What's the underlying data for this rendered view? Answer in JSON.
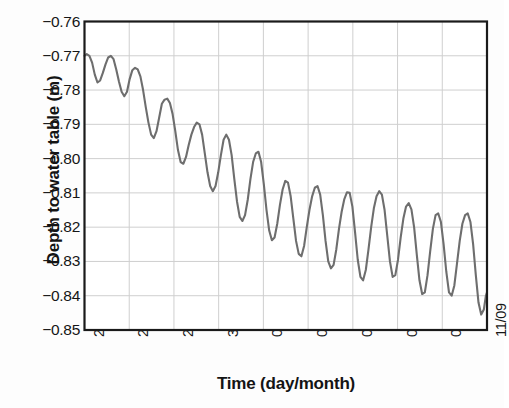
{
  "chart_data": {
    "type": "line",
    "title": "",
    "xlabel": "Time (day/month)",
    "ylabel": "Depth to water table (m)",
    "ylim": [
      -0.85,
      -0.76
    ],
    "ytick_labels": [
      "−0.76",
      "−0.77",
      "−0.78",
      "−0.79",
      "−0.80",
      "−0.81",
      "−0.82",
      "−0.83",
      "−0.84",
      "−0.85"
    ],
    "ytick_values": [
      -0.76,
      -0.77,
      -0.78,
      -0.79,
      -0.8,
      -0.81,
      -0.82,
      -0.83,
      -0.84,
      -0.85
    ],
    "xtick_labels": [
      "24/08",
      "26/08",
      "28/08",
      "30/08",
      "01/09",
      "03/09",
      "05/09",
      "07/09",
      "09/09",
      "11/09"
    ],
    "xtick_values": [
      0,
      2,
      4,
      6,
      8,
      10,
      12,
      14,
      16,
      18
    ],
    "xlim": [
      0,
      18
    ],
    "grid": true,
    "legend": "none",
    "line_color": "#6e6e6e",
    "axis_color": "#1a1a1a",
    "grid_color": "#cfcfcf",
    "background": "#fdfdfd",
    "series": [
      {
        "name": "Depth to water table",
        "x": [
          0.0,
          0.1,
          0.22,
          0.34,
          0.46,
          0.58,
          0.7,
          0.82,
          0.94,
          1.06,
          1.18,
          1.3,
          1.42,
          1.54,
          1.66,
          1.78,
          1.9,
          2.02,
          2.14,
          2.26,
          2.38,
          2.5,
          2.62,
          2.74,
          2.86,
          2.98,
          3.1,
          3.22,
          3.34,
          3.46,
          3.58,
          3.7,
          3.82,
          3.94,
          4.06,
          4.18,
          4.3,
          4.42,
          4.54,
          4.66,
          4.78,
          4.9,
          5.02,
          5.14,
          5.26,
          5.38,
          5.5,
          5.62,
          5.74,
          5.86,
          5.98,
          6.1,
          6.22,
          6.34,
          6.46,
          6.58,
          6.7,
          6.82,
          6.94,
          7.06,
          7.18,
          7.3,
          7.42,
          7.54,
          7.66,
          7.78,
          7.9,
          8.02,
          8.14,
          8.26,
          8.38,
          8.5,
          8.62,
          8.74,
          8.86,
          8.98,
          9.1,
          9.22,
          9.34,
          9.46,
          9.58,
          9.7,
          9.82,
          9.94,
          10.06,
          10.18,
          10.3,
          10.42,
          10.54,
          10.66,
          10.78,
          10.9,
          11.02,
          11.14,
          11.26,
          11.38,
          11.5,
          11.62,
          11.74,
          11.86,
          11.98,
          12.1,
          12.22,
          12.34,
          12.46,
          12.58,
          12.7,
          12.82,
          12.94,
          13.06,
          13.18,
          13.3,
          13.42,
          13.54,
          13.66,
          13.78,
          13.9,
          14.02,
          14.14,
          14.26,
          14.38,
          14.5,
          14.62,
          14.74,
          14.86,
          14.98,
          15.1,
          15.22,
          15.34,
          15.46,
          15.58,
          15.7,
          15.82,
          15.94,
          16.06,
          16.18,
          16.3,
          16.42,
          16.54,
          16.66,
          16.78,
          16.9,
          17.02,
          17.14,
          17.26,
          17.38,
          17.5,
          17.62,
          17.74,
          17.86,
          17.95,
          18.0
        ],
        "y": [
          -0.77,
          -0.7695,
          -0.77,
          -0.772,
          -0.7755,
          -0.7778,
          -0.7772,
          -0.775,
          -0.7725,
          -0.7705,
          -0.77,
          -0.771,
          -0.774,
          -0.7775,
          -0.7805,
          -0.7818,
          -0.7805,
          -0.7768,
          -0.7742,
          -0.7735,
          -0.774,
          -0.776,
          -0.78,
          -0.785,
          -0.7895,
          -0.793,
          -0.794,
          -0.792,
          -0.788,
          -0.784,
          -0.7828,
          -0.7825,
          -0.7838,
          -0.787,
          -0.792,
          -0.7975,
          -0.801,
          -0.8015,
          -0.7995,
          -0.796,
          -0.793,
          -0.7908,
          -0.7895,
          -0.79,
          -0.793,
          -0.7985,
          -0.804,
          -0.808,
          -0.8095,
          -0.808,
          -0.804,
          -0.799,
          -0.7945,
          -0.793,
          -0.7945,
          -0.799,
          -0.806,
          -0.8125,
          -0.817,
          -0.8182,
          -0.8165,
          -0.812,
          -0.806,
          -0.801,
          -0.7985,
          -0.798,
          -0.801,
          -0.8075,
          -0.815,
          -0.821,
          -0.8238,
          -0.823,
          -0.819,
          -0.8135,
          -0.809,
          -0.8065,
          -0.807,
          -0.811,
          -0.8175,
          -0.824,
          -0.8278,
          -0.8285,
          -0.8255,
          -0.82,
          -0.815,
          -0.811,
          -0.8085,
          -0.808,
          -0.8105,
          -0.8165,
          -0.824,
          -0.83,
          -0.832,
          -0.831,
          -0.8265,
          -0.8205,
          -0.8155,
          -0.8118,
          -0.8098,
          -0.81,
          -0.814,
          -0.8215,
          -0.8295,
          -0.8345,
          -0.8355,
          -0.8325,
          -0.8265,
          -0.82,
          -0.8145,
          -0.811,
          -0.8095,
          -0.8105,
          -0.815,
          -0.8225,
          -0.83,
          -0.8345,
          -0.834,
          -0.8295,
          -0.823,
          -0.8175,
          -0.814,
          -0.813,
          -0.8148,
          -0.82,
          -0.828,
          -0.8355,
          -0.8395,
          -0.839,
          -0.834,
          -0.827,
          -0.8205,
          -0.8165,
          -0.816,
          -0.8185,
          -0.825,
          -0.833,
          -0.839,
          -0.84,
          -0.837,
          -0.8305,
          -0.824,
          -0.819,
          -0.8165,
          -0.816,
          -0.8185,
          -0.825,
          -0.834,
          -0.842,
          -0.8455,
          -0.844,
          -0.84,
          -0.839
        ]
      }
    ]
  }
}
